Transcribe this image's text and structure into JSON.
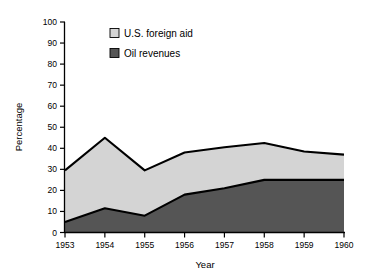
{
  "chart_data": {
    "type": "area",
    "title": "",
    "subtitle": "",
    "xlabel": "Year",
    "ylabel": "Percentage",
    "categories": [
      "1953",
      "1954",
      "1955",
      "1956",
      "1957",
      "1958",
      "1959",
      "1960"
    ],
    "x": [
      1953,
      1954,
      1955,
      1956,
      1957,
      1958,
      1959,
      1960
    ],
    "ylim": [
      0,
      100
    ],
    "yticks": [
      0,
      10,
      20,
      30,
      40,
      50,
      60,
      70,
      80,
      90,
      100
    ],
    "ytick_labels": [
      "0",
      "10",
      "20",
      "30",
      "40",
      "50",
      "60",
      "70",
      "80",
      "90",
      "100"
    ],
    "grid": false,
    "stacked": true,
    "legend_position": "inside-top-left",
    "series": [
      {
        "name": "Oil revenues",
        "color": "#555555",
        "values": [
          5,
          11.5,
          8,
          18,
          21,
          25,
          25,
          25
        ]
      },
      {
        "name": "U.S. foreign aid",
        "color": "#d4d4d4",
        "values": [
          24.5,
          33.5,
          21.5,
          20,
          19.5,
          17.5,
          13.5,
          12
        ]
      }
    ],
    "cumulative_totals": [
      29.5,
      45,
      29.5,
      38,
      40.5,
      42.5,
      38.5,
      37
    ],
    "annotations": []
  },
  "legend": {
    "items": [
      {
        "label": "U.S. foreign aid",
        "swatch_color": "#d4d4d4"
      },
      {
        "label": "Oil revenues",
        "swatch_color": "#555555"
      }
    ]
  },
  "colors": {
    "foreign_aid": "#d4d4d4",
    "oil_revenues": "#555555",
    "outline": "#000000",
    "axis": "#000000",
    "background": "#ffffff"
  }
}
